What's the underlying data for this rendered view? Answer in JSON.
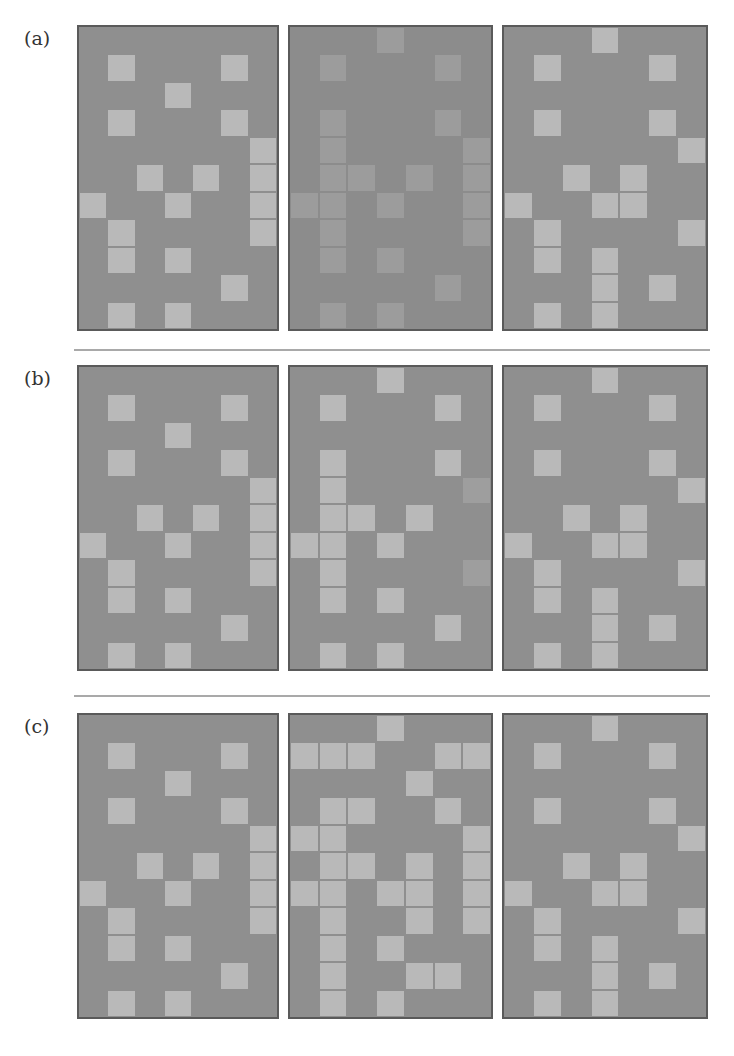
{
  "figure": {
    "grid": {
      "cols": 7,
      "rows": 11
    },
    "colors": {
      "background": "#8f8f8f",
      "light_cell": "#b9b9b9",
      "faint_cell": "#9c9c9c",
      "border": "#5a5a5a",
      "separator": "#a9a9a9"
    },
    "rows": [
      {
        "label": "(a)",
        "top": 25,
        "panels": [
          {
            "name": "original",
            "style": "normal",
            "cells": [
              [
                1,
                1
              ],
              [
                5,
                1
              ],
              [
                3,
                2
              ],
              [
                1,
                3
              ],
              [
                5,
                3
              ],
              [
                6,
                4
              ],
              [
                6,
                5
              ],
              [
                6,
                6
              ],
              [
                6,
                7
              ],
              [
                2,
                5
              ],
              [
                4,
                5
              ],
              [
                0,
                6
              ],
              [
                3,
                6
              ],
              [
                1,
                7
              ],
              [
                1,
                8
              ],
              [
                3,
                8
              ],
              [
                5,
                9
              ],
              [
                1,
                10
              ],
              [
                3,
                10
              ]
            ]
          },
          {
            "name": "modified-low-contrast",
            "style": "faint",
            "cells": [
              [
                3,
                0
              ],
              [
                1,
                1
              ],
              [
                5,
                1
              ],
              [
                1,
                3
              ],
              [
                1,
                4
              ],
              [
                1,
                5
              ],
              [
                1,
                6
              ],
              [
                1,
                7
              ],
              [
                1,
                8
              ],
              [
                5,
                3
              ],
              [
                6,
                4
              ],
              [
                6,
                5
              ],
              [
                6,
                6
              ],
              [
                6,
                7
              ],
              [
                2,
                5
              ],
              [
                4,
                5
              ],
              [
                0,
                6
              ],
              [
                3,
                6
              ],
              [
                3,
                8
              ],
              [
                5,
                9
              ],
              [
                1,
                10
              ],
              [
                3,
                10
              ]
            ]
          },
          {
            "name": "target",
            "style": "normal",
            "cells": [
              [
                3,
                0
              ],
              [
                1,
                1
              ],
              [
                5,
                1
              ],
              [
                1,
                3
              ],
              [
                5,
                3
              ],
              [
                6,
                4
              ],
              [
                2,
                5
              ],
              [
                4,
                5
              ],
              [
                4,
                6
              ],
              [
                0,
                6
              ],
              [
                3,
                6
              ],
              [
                1,
                7
              ],
              [
                1,
                8
              ],
              [
                6,
                7
              ],
              [
                3,
                8
              ],
              [
                3,
                9
              ],
              [
                3,
                10
              ],
              [
                5,
                9
              ],
              [
                1,
                10
              ]
            ]
          }
        ]
      },
      {
        "label": "(b)",
        "top": 365,
        "panels": [
          {
            "name": "original",
            "style": "normal",
            "cells": [
              [
                1,
                1
              ],
              [
                5,
                1
              ],
              [
                3,
                2
              ],
              [
                1,
                3
              ],
              [
                5,
                3
              ],
              [
                6,
                4
              ],
              [
                6,
                5
              ],
              [
                6,
                6
              ],
              [
                6,
                7
              ],
              [
                2,
                5
              ],
              [
                4,
                5
              ],
              [
                0,
                6
              ],
              [
                3,
                6
              ],
              [
                1,
                7
              ],
              [
                1,
                8
              ],
              [
                3,
                8
              ],
              [
                5,
                9
              ],
              [
                1,
                10
              ],
              [
                3,
                10
              ]
            ]
          },
          {
            "name": "modified",
            "style": "normal",
            "cells": [
              [
                3,
                0
              ],
              [
                1,
                1
              ],
              [
                5,
                1
              ],
              [
                1,
                3
              ],
              [
                1,
                4
              ],
              [
                1,
                5
              ],
              [
                1,
                6
              ],
              [
                1,
                7
              ],
              [
                1,
                8
              ],
              [
                5,
                3
              ],
              [
                2,
                5
              ],
              [
                4,
                5
              ],
              [
                0,
                6
              ],
              [
                3,
                6
              ],
              [
                3,
                8
              ],
              [
                5,
                9
              ],
              [
                1,
                10
              ],
              [
                3,
                10
              ]
            ],
            "dim_cells": [
              [
                6,
                4
              ],
              [
                6,
                7
              ]
            ]
          },
          {
            "name": "target",
            "style": "normal",
            "cells": [
              [
                3,
                0
              ],
              [
                1,
                1
              ],
              [
                5,
                1
              ],
              [
                1,
                3
              ],
              [
                5,
                3
              ],
              [
                6,
                4
              ],
              [
                2,
                5
              ],
              [
                4,
                5
              ],
              [
                4,
                6
              ],
              [
                0,
                6
              ],
              [
                3,
                6
              ],
              [
                1,
                7
              ],
              [
                1,
                8
              ],
              [
                6,
                7
              ],
              [
                3,
                8
              ],
              [
                3,
                9
              ],
              [
                3,
                10
              ],
              [
                5,
                9
              ],
              [
                1,
                10
              ]
            ]
          }
        ]
      },
      {
        "label": "(c)",
        "top": 713,
        "panels": [
          {
            "name": "original",
            "style": "normal",
            "cells": [
              [
                1,
                1
              ],
              [
                5,
                1
              ],
              [
                3,
                2
              ],
              [
                1,
                3
              ],
              [
                5,
                3
              ],
              [
                6,
                4
              ],
              [
                6,
                5
              ],
              [
                6,
                6
              ],
              [
                6,
                7
              ],
              [
                2,
                5
              ],
              [
                4,
                5
              ],
              [
                0,
                6
              ],
              [
                3,
                6
              ],
              [
                1,
                7
              ],
              [
                1,
                8
              ],
              [
                3,
                8
              ],
              [
                5,
                9
              ],
              [
                1,
                10
              ],
              [
                3,
                10
              ]
            ]
          },
          {
            "name": "modified-noisy",
            "style": "normal",
            "cells": [
              [
                3,
                0
              ],
              [
                0,
                1
              ],
              [
                1,
                1
              ],
              [
                2,
                1
              ],
              [
                5,
                1
              ],
              [
                6,
                1
              ],
              [
                4,
                2
              ],
              [
                1,
                3
              ],
              [
                1,
                4
              ],
              [
                1,
                5
              ],
              [
                1,
                6
              ],
              [
                1,
                7
              ],
              [
                1,
                8
              ],
              [
                1,
                9
              ],
              [
                1,
                10
              ],
              [
                2,
                3
              ],
              [
                5,
                3
              ],
              [
                0,
                4
              ],
              [
                6,
                4
              ],
              [
                6,
                5
              ],
              [
                6,
                6
              ],
              [
                6,
                7
              ],
              [
                2,
                5
              ],
              [
                4,
                5
              ],
              [
                4,
                6
              ],
              [
                4,
                7
              ],
              [
                0,
                6
              ],
              [
                3,
                6
              ],
              [
                3,
                8
              ],
              [
                4,
                9
              ],
              [
                5,
                9
              ],
              [
                3,
                10
              ]
            ]
          },
          {
            "name": "target",
            "style": "normal",
            "cells": [
              [
                3,
                0
              ],
              [
                1,
                1
              ],
              [
                5,
                1
              ],
              [
                1,
                3
              ],
              [
                5,
                3
              ],
              [
                6,
                4
              ],
              [
                2,
                5
              ],
              [
                4,
                5
              ],
              [
                4,
                6
              ],
              [
                0,
                6
              ],
              [
                3,
                6
              ],
              [
                1,
                7
              ],
              [
                1,
                8
              ],
              [
                6,
                7
              ],
              [
                3,
                8
              ],
              [
                3,
                9
              ],
              [
                3,
                10
              ],
              [
                5,
                9
              ],
              [
                1,
                10
              ]
            ]
          }
        ]
      }
    ],
    "separators": [
      {
        "top": 349
      },
      {
        "top": 695
      }
    ],
    "panel_x": [
      77,
      288,
      502
    ],
    "panel_w": [
      202,
      205,
      206
    ],
    "panel_h": 306
  }
}
